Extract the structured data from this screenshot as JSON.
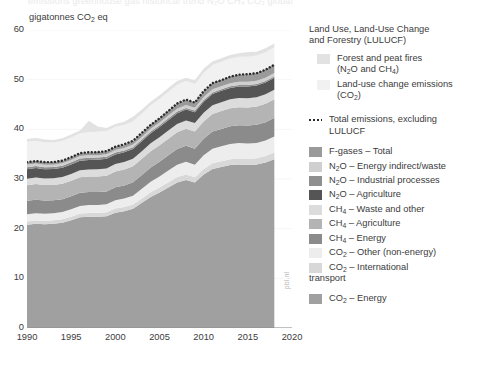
{
  "top_clipped_text": "emissions  greenhouse gas  historical  trend  N₂O  CH₄  CO₂  global",
  "axis": {
    "unit_caption_pre": "gigatonnes CO",
    "unit_caption_sub": "2",
    "unit_caption_post": " eq",
    "y_ticks": [
      "60",
      "50",
      "40",
      "30",
      "20",
      "10",
      "0"
    ],
    "x_ticks": [
      "1990",
      "1995",
      "2000",
      "2005",
      "2010",
      "2015",
      "2020"
    ]
  },
  "credit": "pbl.nl",
  "legend": {
    "header_line1": "Land Use, Land-Use Change",
    "header_line2": "and Forestry (LULUCF)",
    "items": [
      {
        "name": "forest-and-peat-fires",
        "label_a": "Forest and peat fires",
        "label_b": "(N",
        "sub_b": "2",
        "label_c": "O and CH",
        "sub_c": "4",
        "label_d": ")",
        "color": "#e2e2e2",
        "indent": true,
        "type": "swatch"
      },
      {
        "name": "land-use-change-emissions",
        "label_a": "Land-use change emissions",
        "label_b": "(CO",
        "sub_b": "2",
        "label_c": ")",
        "color": "#f1f1f1",
        "indent": true,
        "type": "swatch"
      },
      {
        "name": "total-emissions-excluding-lulucf",
        "label_a": "Total emissions, excluding",
        "label_b": "LULUCF",
        "color": "#2b2b2b",
        "type": "dotted"
      },
      {
        "name": "f-gases-total",
        "label_a": "F-gases – Total",
        "color": "#9a9a9a",
        "type": "swatch"
      },
      {
        "name": "n2o-energy-indirect-waste",
        "label_a": "N",
        "sub_a": "2",
        "label_b": "O – Energy indirect/waste",
        "color": "#cfcfcf",
        "type": "swatch"
      },
      {
        "name": "n2o-industrial-processes",
        "label_a": "N",
        "sub_a": "2",
        "label_b": "O – Industrial processes",
        "color": "#8f8f8f",
        "type": "swatch"
      },
      {
        "name": "n2o-agriculture",
        "label_a": "N",
        "sub_a": "2",
        "label_b": "O – Agriculture",
        "color": "#555555",
        "type": "swatch"
      },
      {
        "name": "ch4-waste-and-other",
        "label_a": "CH",
        "sub_a": "4",
        "label_b": " – Waste and other",
        "color": "#dcdcdc",
        "type": "swatch"
      },
      {
        "name": "ch4-agriculture",
        "label_a": "CH",
        "sub_a": "4",
        "label_b": " – Agriculture",
        "color": "#b4b4b4",
        "type": "swatch"
      },
      {
        "name": "ch4-energy",
        "label_a": "CH",
        "sub_a": "4",
        "label_b": " – Energy",
        "color": "#8b8b8b",
        "type": "swatch"
      },
      {
        "name": "co2-other-non-energy",
        "label_a": "CO",
        "sub_a": "2",
        "label_b": " – Other (non-energy)",
        "color": "#ededed",
        "type": "swatch"
      },
      {
        "name": "co2-international-transport",
        "label_a": "CO",
        "sub_a": "2",
        "label_b": " – International",
        "label_c": "transport",
        "color": "#d8d8d8",
        "type": "swatch"
      },
      {
        "name": "co2-energy",
        "label_a": "CO",
        "sub_a": "2",
        "label_b": " – Energy",
        "color": "#a0a0a0",
        "type": "swatch"
      }
    ]
  },
  "chart_data": {
    "type": "area",
    "title": "",
    "xlabel": "",
    "ylabel": "gigatonnes CO2 eq",
    "xlim": [
      1990,
      2020
    ],
    "ylim": [
      0,
      60
    ],
    "grid": true,
    "legend_position": "right",
    "x": [
      1990,
      1991,
      1992,
      1993,
      1994,
      1995,
      1996,
      1997,
      1998,
      1999,
      2000,
      2001,
      2002,
      2003,
      2004,
      2005,
      2006,
      2007,
      2008,
      2009,
      2010,
      2011,
      2012,
      2013,
      2014,
      2015,
      2016,
      2017,
      2018
    ],
    "stack_order_bottom_to_top": [
      "CO2 - Energy",
      "CO2 - International transport",
      "CO2 - Other (non-energy)",
      "CH4 - Energy",
      "CH4 - Agriculture",
      "CH4 - Waste and other",
      "N2O - Agriculture",
      "N2O - Industrial processes",
      "N2O - Energy indirect/waste",
      "F-gases - Total",
      "Land-use change emissions (CO2)",
      "Forest and peat fires (N2O and CH4)"
    ],
    "series": [
      {
        "name": "CO2 - Energy",
        "color": "#a0a0a0",
        "values": [
          20.8,
          21.0,
          20.9,
          21.0,
          21.2,
          21.7,
          22.3,
          22.4,
          22.4,
          22.5,
          23.2,
          23.5,
          24.0,
          25.2,
          26.4,
          27.3,
          28.3,
          29.3,
          29.8,
          29.3,
          30.9,
          32.0,
          32.4,
          32.8,
          32.9,
          32.8,
          32.9,
          33.3,
          34.0
        ]
      },
      {
        "name": "CO2 - International transport",
        "color": "#d8d8d8",
        "values": [
          0.65,
          0.66,
          0.67,
          0.67,
          0.69,
          0.71,
          0.74,
          0.77,
          0.79,
          0.82,
          0.86,
          0.85,
          0.86,
          0.89,
          0.95,
          1.0,
          1.04,
          1.09,
          1.1,
          1.07,
          1.12,
          1.16,
          1.17,
          1.18,
          1.21,
          1.24,
          1.28,
          1.32,
          1.36
        ]
      },
      {
        "name": "CO2 - Other (non-energy)",
        "color": "#ededed",
        "values": [
          1.45,
          1.45,
          1.42,
          1.42,
          1.45,
          1.5,
          1.53,
          1.57,
          1.58,
          1.6,
          1.66,
          1.7,
          1.78,
          1.95,
          2.1,
          2.22,
          2.36,
          2.5,
          2.55,
          2.52,
          2.76,
          2.95,
          3.02,
          3.08,
          3.12,
          3.1,
          3.08,
          3.12,
          3.18
        ]
      },
      {
        "name": "CH4 - Energy",
        "color": "#8b8b8b",
        "values": [
          2.7,
          2.72,
          2.66,
          2.62,
          2.6,
          2.62,
          2.66,
          2.62,
          2.6,
          2.58,
          2.62,
          2.66,
          2.7,
          2.78,
          2.88,
          2.96,
          3.06,
          3.14,
          3.22,
          3.2,
          3.32,
          3.44,
          3.5,
          3.56,
          3.6,
          3.62,
          3.64,
          3.7,
          3.78
        ]
      },
      {
        "name": "CH4 - Agriculture",
        "color": "#b4b4b4",
        "values": [
          3.15,
          3.15,
          3.12,
          3.1,
          3.1,
          3.12,
          3.14,
          3.14,
          3.15,
          3.16,
          3.18,
          3.2,
          3.22,
          3.24,
          3.28,
          3.32,
          3.36,
          3.4,
          3.44,
          3.46,
          3.5,
          3.54,
          3.58,
          3.6,
          3.64,
          3.66,
          3.68,
          3.7,
          3.72
        ]
      },
      {
        "name": "CH4 - Waste and other",
        "color": "#dcdcdc",
        "values": [
          1.3,
          1.32,
          1.33,
          1.34,
          1.36,
          1.38,
          1.4,
          1.42,
          1.44,
          1.46,
          1.48,
          1.5,
          1.52,
          1.54,
          1.57,
          1.6,
          1.63,
          1.66,
          1.69,
          1.71,
          1.74,
          1.77,
          1.8,
          1.82,
          1.84,
          1.86,
          1.88,
          1.9,
          1.92
        ]
      },
      {
        "name": "N2O - Agriculture",
        "color": "#555555",
        "values": [
          1.9,
          1.9,
          1.88,
          1.86,
          1.88,
          1.9,
          1.92,
          1.92,
          1.93,
          1.94,
          1.95,
          1.96,
          1.98,
          2.0,
          2.04,
          2.07,
          2.1,
          2.14,
          2.17,
          2.18,
          2.22,
          2.26,
          2.28,
          2.3,
          2.33,
          2.35,
          2.37,
          2.39,
          2.41
        ]
      },
      {
        "name": "N2O - Industrial processes",
        "color": "#8f8f8f",
        "values": [
          0.42,
          0.42,
          0.41,
          0.4,
          0.41,
          0.42,
          0.43,
          0.43,
          0.42,
          0.4,
          0.38,
          0.36,
          0.35,
          0.35,
          0.36,
          0.36,
          0.36,
          0.36,
          0.35,
          0.33,
          0.33,
          0.32,
          0.31,
          0.31,
          0.31,
          0.31,
          0.31,
          0.32,
          0.32
        ]
      },
      {
        "name": "N2O - Energy indirect/waste",
        "color": "#cfcfcf",
        "values": [
          0.48,
          0.48,
          0.47,
          0.47,
          0.47,
          0.48,
          0.49,
          0.49,
          0.49,
          0.5,
          0.5,
          0.51,
          0.52,
          0.53,
          0.54,
          0.55,
          0.56,
          0.57,
          0.58,
          0.58,
          0.6,
          0.61,
          0.62,
          0.63,
          0.64,
          0.64,
          0.65,
          0.66,
          0.67
        ]
      },
      {
        "name": "F-gases - Total",
        "color": "#9a9a9a",
        "values": [
          0.55,
          0.56,
          0.55,
          0.53,
          0.52,
          0.55,
          0.58,
          0.6,
          0.62,
          0.64,
          0.68,
          0.7,
          0.74,
          0.78,
          0.84,
          0.9,
          0.96,
          1.02,
          1.08,
          1.1,
          1.18,
          1.26,
          1.32,
          1.38,
          1.44,
          1.5,
          1.56,
          1.62,
          1.68
        ]
      },
      {
        "name": "Land-use change emissions (CO2)",
        "color": "#f1f1f1",
        "values": [
          4.1,
          4.05,
          4.0,
          3.95,
          3.95,
          3.98,
          4.0,
          4.05,
          4.1,
          4.05,
          4.0,
          3.95,
          3.95,
          3.9,
          3.88,
          3.85,
          3.8,
          3.78,
          3.75,
          3.7,
          3.68,
          3.65,
          3.62,
          3.6,
          3.58,
          3.55,
          3.52,
          3.5,
          3.48
        ]
      },
      {
        "name": "Forest and peat fires (N2O and CH4)",
        "color": "#e2e2e2",
        "values": [
          0.55,
          0.55,
          0.52,
          0.5,
          0.55,
          0.6,
          0.58,
          2.3,
          1.05,
          0.6,
          0.58,
          0.62,
          0.9,
          0.85,
          0.7,
          0.75,
          0.8,
          0.78,
          0.65,
          0.72,
          0.85,
          0.7,
          0.68,
          0.72,
          0.7,
          0.95,
          0.75,
          0.8,
          0.78
        ]
      }
    ],
    "total_excluding_lulucf": [
      33.4,
      33.6,
      33.4,
      33.4,
      33.7,
      34.4,
      35.2,
      35.4,
      35.4,
      35.6,
      36.5,
      37.0,
      37.7,
      39.3,
      40.9,
      42.2,
      43.7,
      45.2,
      46.0,
      45.4,
      47.7,
      49.3,
      49.9,
      50.6,
      51.0,
      51.1,
      51.3,
      52.0,
      53.0
    ]
  }
}
